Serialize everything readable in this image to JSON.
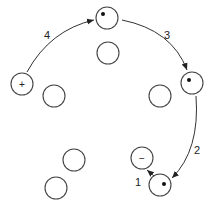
{
  "diagram": {
    "circles": [
      {
        "id": "top",
        "cx": 107,
        "cy": 18,
        "marker": "dot"
      },
      {
        "id": "upper-center",
        "cx": 108,
        "cy": 53,
        "marker": ""
      },
      {
        "id": "left-plus",
        "cx": 22,
        "cy": 84,
        "marker": "+"
      },
      {
        "id": "left-mid",
        "cx": 54,
        "cy": 96,
        "marker": ""
      },
      {
        "id": "right-mid",
        "cx": 160,
        "cy": 96,
        "marker": ""
      },
      {
        "id": "right-dot",
        "cx": 192,
        "cy": 83,
        "marker": "dot"
      },
      {
        "id": "lower-left-1",
        "cx": 74,
        "cy": 160,
        "marker": ""
      },
      {
        "id": "lower-left-2",
        "cx": 56,
        "cy": 188,
        "marker": ""
      },
      {
        "id": "minus",
        "cx": 142,
        "cy": 158,
        "marker": "−"
      },
      {
        "id": "bottom-dot",
        "cx": 160,
        "cy": 185,
        "marker": "dot"
      }
    ],
    "arrows": [
      {
        "label": "1",
        "from": "bottom-dot",
        "to": "minus"
      },
      {
        "label": "2",
        "from": "right-dot",
        "to": "bottom-dot"
      },
      {
        "label": "3",
        "from": "top",
        "to": "right-dot"
      },
      {
        "label": "4",
        "from": "left-plus",
        "to": "top"
      }
    ],
    "labels": {
      "a1": "1",
      "a2": "2",
      "a3": "3",
      "a4": "4",
      "plus": "+",
      "minus": "−"
    },
    "colors": {
      "stroke": "#333333",
      "background": "#ffffff"
    }
  }
}
